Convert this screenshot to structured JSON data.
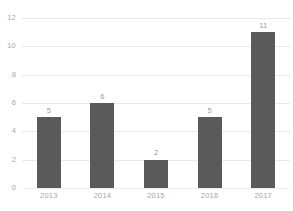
{
  "chart_data": {
    "type": "bar",
    "title": "",
    "subtitle": "",
    "xlabel": "",
    "ylabel": "",
    "categories": [
      "2013",
      "2014",
      "2015",
      "2016",
      "2017"
    ],
    "values": [
      5,
      6,
      2,
      5,
      11
    ],
    "data_labels": [
      "5",
      "6",
      "2",
      "5",
      "11"
    ],
    "ylim": [
      0,
      12
    ],
    "yticks": [
      0,
      2,
      4,
      6,
      8,
      10,
      12
    ],
    "ytick_labels": [
      "0",
      "2",
      "4",
      "6",
      "8",
      "10",
      "12"
    ],
    "grid": "horizontal",
    "legend": "none",
    "series": [
      {
        "name": "",
        "values": [
          5,
          6,
          2,
          5,
          11
        ]
      }
    ],
    "colors": {
      "bar": "#5a5a5a",
      "gridline": "#e9e9e9",
      "tick_text": "#a6a6a6",
      "data_label_text": "#9a9a9a",
      "background": "#ffffff"
    }
  }
}
